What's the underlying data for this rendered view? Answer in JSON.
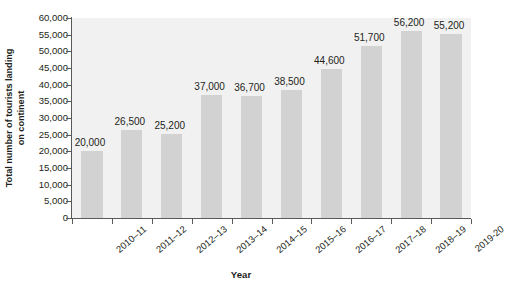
{
  "chart_data": {
    "type": "bar",
    "title": "",
    "xlabel": "Year",
    "ylabel": "Total number of tourists landing on continent",
    "ylabel_lines": [
      "Total number of tourists landing",
      "on continent"
    ],
    "categories": [
      "2010–11",
      "2011–12",
      "2012–13",
      "2013–14",
      "2014–15",
      "2015–16",
      "2016–17",
      "2017–18",
      "2018–19",
      "2019-20"
    ],
    "values": [
      20000,
      26500,
      25200,
      37000,
      36700,
      38500,
      44600,
      51700,
      56200,
      55200
    ],
    "value_labels": [
      "20,000",
      "26,500",
      "25,200",
      "37,000",
      "36,700",
      "38,500",
      "44,600",
      "51,700",
      "56,200",
      "55,200"
    ],
    "ylim": [
      0,
      60000
    ],
    "ytick_values": [
      0,
      5000,
      10000,
      15000,
      20000,
      25000,
      30000,
      35000,
      40000,
      45000,
      50000,
      55000,
      60000
    ],
    "ytick_labels": [
      "0",
      "5,000",
      "10,000",
      "15,000",
      "20,000",
      "25,000",
      "30,000",
      "35,000",
      "40,000",
      "45,000",
      "50,000",
      "55,000",
      "60,000"
    ],
    "grid": false,
    "legend": false,
    "bar_color": "#d2d2d2",
    "plot_background": "#f1f1f1",
    "axis_color": "#58595b",
    "text_color": "#231f20"
  }
}
